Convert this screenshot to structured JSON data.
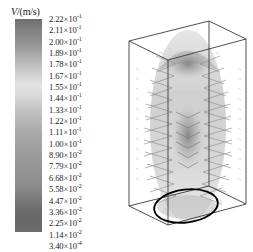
{
  "figure": {
    "type": "cfd-velocity-vector-field",
    "background_color": "#ffffff"
  },
  "legend": {
    "title_symbol": "V",
    "title_unit": "/(m/s)",
    "colormap": "grayscale",
    "colorbar": {
      "orientation": "vertical",
      "top_color": "#6e6e6e",
      "highlight_color": "#e2e2e2",
      "bottom_color": "#686868"
    },
    "ticks": [
      {
        "mantissa": "2.22",
        "exponent": "-1"
      },
      {
        "mantissa": "2.11",
        "exponent": "-1"
      },
      {
        "mantissa": "2.00",
        "exponent": "-1"
      },
      {
        "mantissa": "1.89",
        "exponent": "-1"
      },
      {
        "mantissa": "1.78",
        "exponent": "-1"
      },
      {
        "mantissa": "1.67",
        "exponent": "-1"
      },
      {
        "mantissa": "1.55",
        "exponent": "-1"
      },
      {
        "mantissa": "1.44",
        "exponent": "-1"
      },
      {
        "mantissa": "1.33",
        "exponent": "-1"
      },
      {
        "mantissa": "1.22",
        "exponent": "-1"
      },
      {
        "mantissa": "1.11",
        "exponent": "-1"
      },
      {
        "mantissa": "1.00",
        "exponent": "-1"
      },
      {
        "mantissa": "8.90",
        "exponent": "-2"
      },
      {
        "mantissa": "7.79",
        "exponent": "-2"
      },
      {
        "mantissa": "6.68",
        "exponent": "-2"
      },
      {
        "mantissa": "5.58",
        "exponent": "-2"
      },
      {
        "mantissa": "4.47",
        "exponent": "-2"
      },
      {
        "mantissa": "3.36",
        "exponent": "-2"
      },
      {
        "mantissa": "2.25",
        "exponent": "-2"
      },
      {
        "mantissa": "1.14",
        "exponent": "-2"
      },
      {
        "mantissa": "3.40",
        "exponent": "-4"
      }
    ]
  },
  "chart_data": {
    "type": "heatmap",
    "title": "",
    "xlabel": "",
    "ylabel": "",
    "legend_title": "V/(m/s)",
    "colorbar_label_values": [
      0.222,
      0.211,
      0.2,
      0.189,
      0.178,
      0.167,
      0.155,
      0.144,
      0.133,
      0.122,
      0.111,
      0.1,
      0.089,
      0.0779,
      0.0668,
      0.0558,
      0.0447,
      0.0336,
      0.0225,
      0.0114,
      0.00034
    ],
    "value_range": [
      0.00034,
      0.222
    ],
    "units": "m/s",
    "grid": false,
    "legend_position": "left",
    "plot_description": "3D rectangular wireframe domain viewed in perspective containing a grayscale velocity-magnitude vector field with symmetric chevron-shaped plume structures rising along the vertical axis; a bold black ellipse is drawn on the bottom face."
  },
  "plot": {
    "box_edge_color": "#3a3a3a",
    "ellipse_color": "#000000",
    "vector_field_color": "#8a8a8a"
  }
}
